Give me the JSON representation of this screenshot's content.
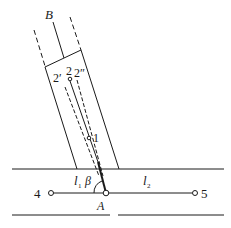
{
  "diagram": {
    "type": "geometry-schematic",
    "labels": {
      "B": "B",
      "A": "A",
      "p1": "1",
      "p2": "2",
      "p2prime": "2′",
      "p2dprime": "2″",
      "p4": "4",
      "p5": "5",
      "l1": "l",
      "l1_sub": "1",
      "l2": "l",
      "l2_sub": "2",
      "beta": "β"
    },
    "colors": {
      "stroke": "#1a1a1a",
      "background": "#ffffff"
    }
  }
}
